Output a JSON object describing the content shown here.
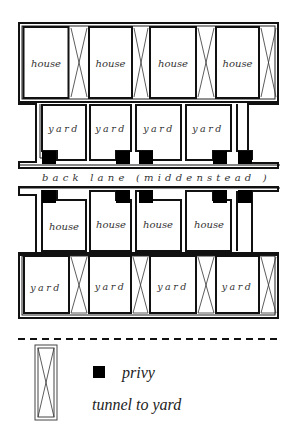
{
  "diagram": {
    "colors": {
      "line": "#111111",
      "privy": "#000000",
      "background": "#ffffff",
      "text": "#333333"
    },
    "top_row": {
      "houses": [
        {
          "label": "house"
        },
        {
          "label": "house"
        },
        {
          "label": "house"
        },
        {
          "label": "house"
        }
      ],
      "tunnel_count": 4
    },
    "upper_yards": {
      "yards": [
        {
          "label": "yard"
        },
        {
          "label": "yard"
        },
        {
          "label": "yard"
        },
        {
          "label": "yard"
        }
      ]
    },
    "back_lane": {
      "label": "back lane (middenstead )"
    },
    "lower_houses": {
      "houses": [
        {
          "label": "house"
        },
        {
          "label": "house"
        },
        {
          "label": "house"
        },
        {
          "label": "house"
        }
      ]
    },
    "bottom_row": {
      "yards": [
        {
          "label": "yard"
        },
        {
          "label": "yard"
        },
        {
          "label": "yard"
        },
        {
          "label": "yard"
        }
      ],
      "tunnel_count": 4
    },
    "privies": {
      "upper_count": 5,
      "lower_count": 5
    },
    "legend": {
      "privy": {
        "symbol": "black-square",
        "label": "privy"
      },
      "tunnel": {
        "symbol": "crossed-rectangle",
        "label": "tunnel to yard"
      }
    }
  }
}
